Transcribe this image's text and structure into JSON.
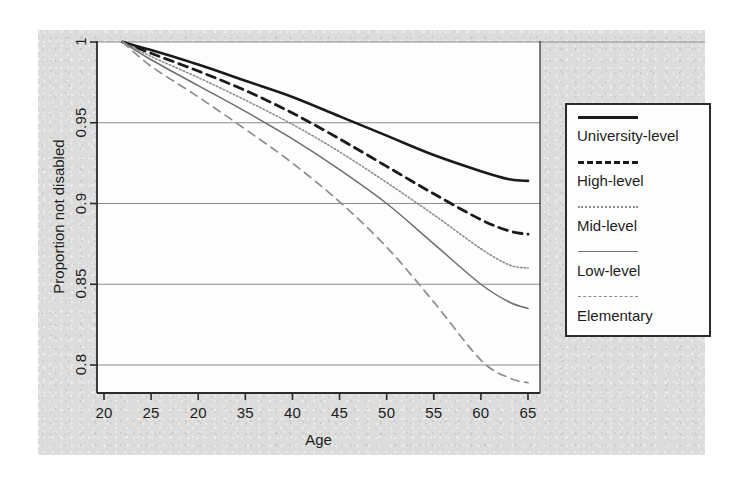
{
  "chart_data": {
    "type": "line",
    "title": "",
    "xlabel": "Age",
    "ylabel": "Proportion not disabled",
    "xlim": [
      20,
      66
    ],
    "ylim": [
      0.78,
      1.005
    ],
    "grid": true,
    "grid_axis": "y",
    "legend_position": "right-outside",
    "xticks": [
      20,
      25,
      20,
      35,
      40,
      45,
      50,
      55,
      60,
      65
    ],
    "xtick_values": [
      20,
      25,
      30,
      35,
      40,
      45,
      50,
      55,
      60,
      65
    ],
    "yticks": [
      "1",
      "0.95",
      "0.9",
      "0.85",
      "0.8"
    ],
    "ytick_values": [
      1,
      0.95,
      0.9,
      0.85,
      0.8
    ],
    "x": [
      22,
      25,
      30,
      35,
      40,
      45,
      50,
      55,
      60,
      63,
      65
    ],
    "series": [
      {
        "name": "University-level",
        "style": "solid-thick",
        "color": "#1a1a1a",
        "values": [
          1.0,
          0.995,
          0.986,
          0.976,
          0.966,
          0.954,
          0.942,
          0.93,
          0.92,
          0.915,
          0.914
        ]
      },
      {
        "name": "High-level",
        "style": "dashed-thick",
        "color": "#1a1a1a",
        "values": [
          1.0,
          0.993,
          0.982,
          0.97,
          0.956,
          0.94,
          0.923,
          0.906,
          0.89,
          0.883,
          0.881
        ]
      },
      {
        "name": "Mid-level",
        "style": "dotted",
        "color": "#8d8d8d",
        "values": [
          1.0,
          0.991,
          0.978,
          0.964,
          0.949,
          0.932,
          0.913,
          0.893,
          0.872,
          0.862,
          0.86
        ]
      },
      {
        "name": "Low-level",
        "style": "solid-thin",
        "color": "#6e6e6e",
        "values": [
          1.0,
          0.989,
          0.973,
          0.957,
          0.94,
          0.921,
          0.9,
          0.875,
          0.85,
          0.839,
          0.835
        ]
      },
      {
        "name": "Elementary",
        "style": "dashed-thin",
        "color": "#8d8d8d",
        "values": [
          1.0,
          0.985,
          0.966,
          0.946,
          0.925,
          0.901,
          0.873,
          0.839,
          0.803,
          0.792,
          0.789
        ]
      }
    ]
  },
  "axes": {
    "y_title": "Proportion not disabled",
    "x_title": "Age",
    "y_labels": [
      "1",
      "0.95",
      "0.9",
      "0.85",
      "0.8"
    ],
    "x_labels": [
      "20",
      "25",
      "20",
      "35",
      "40",
      "45",
      "50",
      "55",
      "60",
      "65"
    ]
  },
  "legend": {
    "items": [
      {
        "label": "University-level",
        "style": "solid-thick"
      },
      {
        "label": "High-level",
        "style": "dashed-thick"
      },
      {
        "label": "Mid-level",
        "style": "dotted"
      },
      {
        "label": "Low-level",
        "style": "solid-thin"
      },
      {
        "label": "Elementary",
        "style": "dashed-thin"
      }
    ]
  },
  "colors": {
    "page_background": "#ffffff",
    "scan_background": "#dcdcdc",
    "plot_background": "#fdfdfd",
    "axis": "#2b2b2b",
    "gridline": "#8a8a8a",
    "text": "#1d1d1d"
  }
}
